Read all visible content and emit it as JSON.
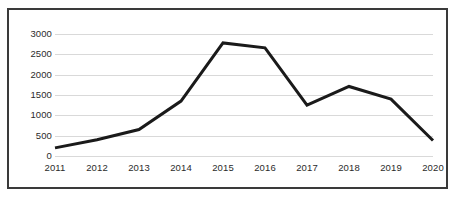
{
  "chart_data": {
    "type": "line",
    "title": "",
    "subtitle": "",
    "xlabel": "",
    "ylabel": "",
    "categories": [
      "2011",
      "2012",
      "2013",
      "2014",
      "2015",
      "2016",
      "2017",
      "2018",
      "2019",
      "2020"
    ],
    "series": [
      {
        "name": "series-1",
        "values": [
          200,
          400,
          650,
          1350,
          2780,
          2660,
          1250,
          1710,
          1400,
          380
        ],
        "color": "#1a1a1a",
        "line_width": 3
      }
    ],
    "x": [
      "2011",
      "2012",
      "2013",
      "2014",
      "2015",
      "2016",
      "2017",
      "2018",
      "2019",
      "2020"
    ],
    "xlim": [
      "2011",
      "2020"
    ],
    "ylim": [
      0,
      3000
    ],
    "y_ticks": [
      0,
      500,
      1000,
      1500,
      2000,
      2500,
      3000
    ],
    "y_tick_labels": [
      "0",
      "500",
      "1000",
      "1500",
      "2000",
      "2500",
      "3000"
    ],
    "x_tick_labels": [
      "2011",
      "2012",
      "2013",
      "2014",
      "2015",
      "2016",
      "2017",
      "2018",
      "2019",
      "2020"
    ],
    "grid": {
      "horizontal": true,
      "vertical": false,
      "color": "#d9d9d9"
    },
    "legend": {
      "visible": false,
      "position": "none",
      "entries": []
    },
    "markers": false,
    "annotations": []
  },
  "figure": {
    "border_color": "#3a3a3a",
    "background_color": "#ffffff",
    "text_color": "#2b2b2b"
  }
}
